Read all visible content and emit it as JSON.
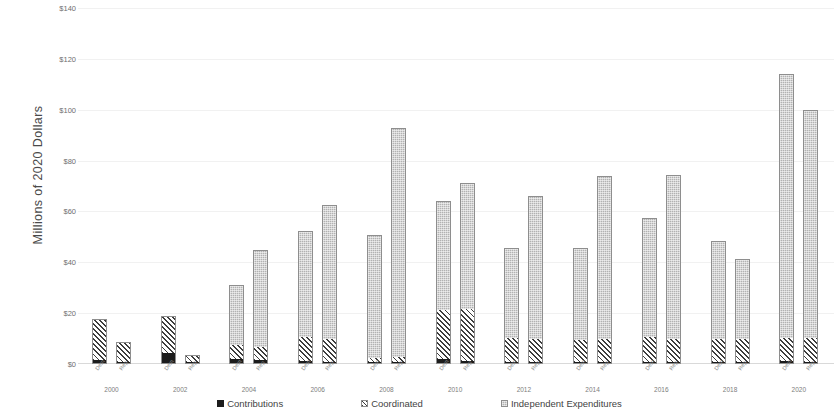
{
  "chart_data": {
    "type": "bar",
    "stacked": true,
    "title": "",
    "xlabel": "",
    "ylabel": "Millions of 2020 Dollars",
    "ylim": [
      0,
      140
    ],
    "ytick_values": [
      0,
      20,
      40,
      60,
      80,
      100,
      120,
      140
    ],
    "ytick_labels": [
      "$0",
      "$20",
      "$40",
      "$60",
      "$80",
      "$100",
      "$120",
      "$140"
    ],
    "grid": true,
    "legend_position": "bottom",
    "categories": [
      "2000",
      "2002",
      "2004",
      "2006",
      "2008",
      "2010",
      "2012",
      "2014",
      "2016",
      "2018",
      "2020"
    ],
    "subcategories": [
      "Dem",
      "Rep"
    ],
    "series": [
      {
        "name": "Contributions",
        "color": "#1c1c1c",
        "pattern": "solid",
        "values_dem": [
          1.2,
          4.0,
          1.8,
          1.0,
          0.3,
          1.6,
          0.4,
          0.4,
          0.4,
          0.4,
          0.8
        ],
        "values_rep": [
          0.3,
          0.4,
          1.2,
          0.6,
          0.3,
          0.7,
          0.4,
          0.4,
          0.4,
          0.4,
          0.4
        ]
      },
      {
        "name": "Coordinated",
        "color": "#3d3d3d",
        "pattern": "diagonal-hatch",
        "values_dem": [
          16.5,
          14.8,
          5.5,
          9.5,
          1.9,
          19.6,
          9.5,
          9.0,
          9.8,
          9.4,
          9.3
        ],
        "values_rep": [
          8.5,
          3.3,
          5.2,
          9.0,
          2.0,
          20.8,
          9.2,
          9.2,
          9.2,
          9.3,
          9.4
        ]
      },
      {
        "name": "Independent Expenditures",
        "color": "#b2b2b2",
        "pattern": "dotted-fill",
        "values_dem": [
          0.0,
          0.0,
          23.7,
          42.0,
          48.5,
          42.8,
          35.6,
          36.2,
          47.1,
          38.6,
          104.0
        ],
        "values_rep": [
          0.0,
          0.0,
          38.6,
          52.9,
          90.4,
          49.5,
          56.4,
          64.3,
          64.8,
          31.7,
          90.2
        ]
      }
    ],
    "totals_dem": [
      17.7,
      18.8,
      31.0,
      52.5,
      50.7,
      64.0,
      45.5,
      45.6,
      57.3,
      48.4,
      114.1
    ],
    "totals_rep": [
      8.8,
      3.7,
      45.0,
      62.5,
      93.0,
      71.0,
      66.0,
      73.8,
      74.4,
      41.5,
      100.0
    ]
  },
  "axis": {
    "y_title": "Millions of 2020 Dollars"
  },
  "legend": {
    "items": [
      {
        "label": "Contributions",
        "swatch": "contributions-swatch"
      },
      {
        "label": "Coordinated",
        "swatch": "coordinated-swatch"
      },
      {
        "label": "Independent Expenditures",
        "swatch": "independent-expenditures-swatch"
      }
    ]
  }
}
